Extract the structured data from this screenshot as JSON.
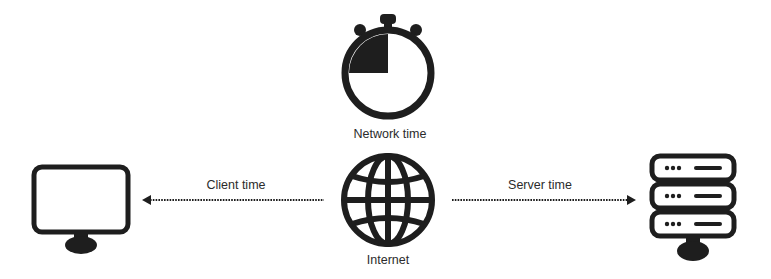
{
  "diagram": {
    "nodes": {
      "stopwatch": {
        "label": "Network time",
        "icon": "stopwatch-icon"
      },
      "globe": {
        "label": "Internet",
        "icon": "globe-icon"
      },
      "client": {
        "icon": "monitor-icon"
      },
      "server": {
        "icon": "server-rack-icon"
      }
    },
    "edges": [
      {
        "from": "globe",
        "to": "client",
        "label": "Client time",
        "style": "dotted",
        "direction": "left"
      },
      {
        "from": "globe",
        "to": "server",
        "label": "Server time",
        "style": "dotted",
        "direction": "right"
      }
    ],
    "colors": {
      "icon": "#1e1e1e",
      "text": "#2b2b2b",
      "background": "#ffffff"
    }
  }
}
